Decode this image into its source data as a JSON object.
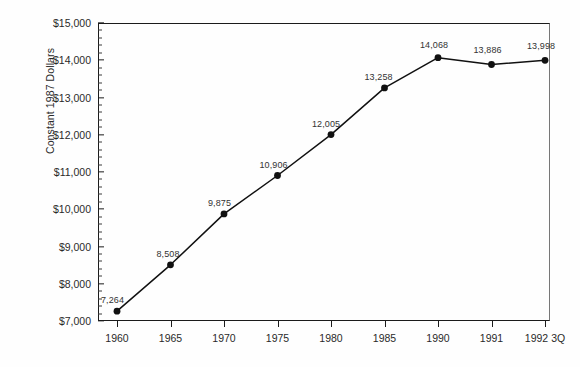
{
  "chart_data": {
    "type": "line",
    "title": "",
    "subtitle": "",
    "xlabel": "",
    "ylabel": "Constant 1987 Dollars",
    "categories": [
      "1960",
      "1965",
      "1970",
      "1975",
      "1980",
      "1985",
      "1990",
      "1991",
      "1992 3Q"
    ],
    "values": [
      7264,
      8508,
      9875,
      10906,
      12005,
      13258,
      14068,
      13886,
      13998
    ],
    "point_labels": [
      "7,264",
      "8,508",
      "9,875",
      "10,906",
      "12,005",
      "13,258",
      "14,068",
      "13,886",
      "13,998"
    ],
    "ylim": [
      7000,
      15000
    ],
    "y_tick_labels": [
      "$15,000",
      "$14,000",
      "$13,000",
      "$12,000",
      "$11,000",
      "$10,000",
      "$9,000",
      "$8,000",
      "$7,000"
    ],
    "y_tick_values": [
      15000,
      14000,
      13000,
      12000,
      11000,
      10000,
      9000,
      8000,
      7000
    ],
    "y_major_step": 1000,
    "y_minor_step": 200,
    "grid": false,
    "legend": false,
    "legend_position": "none",
    "series": [
      {
        "name": "Constant 1987 Dollars",
        "values": [
          7264,
          8508,
          9875,
          10906,
          12005,
          13258,
          14068,
          13886,
          13998
        ],
        "line_color": "#111111",
        "marker_color": "#111111",
        "marker": "circle"
      }
    ],
    "colors": {
      "background": "#fefefe",
      "axis": "#1b1b1b",
      "text": "#2a2a2a",
      "line": "#111111",
      "marker": "#111111",
      "data_label": "#333333"
    },
    "label_offsets": [
      {
        "dx": -16,
        "dy": -16
      },
      {
        "dx": -14,
        "dy": -16
      },
      {
        "dx": -16,
        "dy": -16
      },
      {
        "dx": -18,
        "dy": -16
      },
      {
        "dx": -19,
        "dy": -16
      },
      {
        "dx": -20,
        "dy": -16
      },
      {
        "dx": -18,
        "dy": -18
      },
      {
        "dx": -18,
        "dy": -19
      },
      {
        "dx": -18,
        "dy": -19
      }
    ]
  }
}
